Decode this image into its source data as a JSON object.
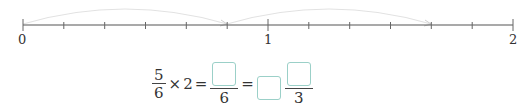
{
  "number_line": {
    "labels": [
      "0",
      "1",
      "2"
    ],
    "divisions_per_unit": 6,
    "jumps": [
      {
        "from": "0",
        "to": "5/6"
      },
      {
        "from": "5/6",
        "to": "10/6"
      }
    ]
  },
  "equation": {
    "frac1_num": "5",
    "frac1_den": "6",
    "times": "×",
    "multiplier": "2",
    "eq1": "=",
    "frac2_den": "6",
    "eq2": "=",
    "frac3_den": "3"
  }
}
